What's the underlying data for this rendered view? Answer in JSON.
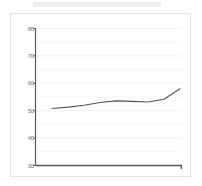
{
  "card": {
    "background_color": "#ffffff",
    "border_color": "#e3e3e5"
  },
  "chart_data": {
    "type": "line",
    "title": "",
    "subtitle": "",
    "xlabel": "",
    "ylabel": "",
    "grid": true,
    "grid_orientation": "horizontal",
    "legend": false,
    "legend_position": "none",
    "ylim": [
      30,
      80
    ],
    "yticks": [
      30,
      40,
      50,
      60,
      70,
      80
    ],
    "ytick_labels": [
      "30",
      "40",
      "50",
      "60",
      "70",
      "80"
    ],
    "xlim": [
      0,
      10
    ],
    "xticks": [],
    "xtick_labels": [],
    "line_color": "#555558",
    "axis_color": "#58585c",
    "grid_color": "#f0f0f2",
    "series": [
      {
        "name": "series-1",
        "color": "#555558",
        "x": [
          1.0,
          2.0,
          3.0,
          4.0,
          5.0,
          6.0,
          7.0,
          8.0,
          9.0
        ],
        "values": [
          50.8,
          51.3,
          52.0,
          53.0,
          53.6,
          53.4,
          53.2,
          54.2,
          58.0
        ]
      }
    ]
  }
}
